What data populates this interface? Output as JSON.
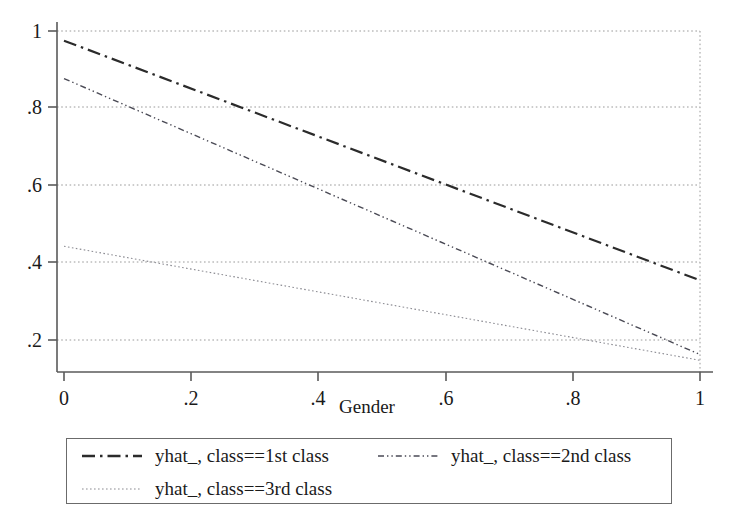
{
  "chart_data": {
    "type": "line",
    "title": "",
    "xlabel": "Gender",
    "ylabel": "",
    "xlim": [
      0,
      1
    ],
    "ylim": [
      0.115,
      1.045
    ],
    "grid": true,
    "grid_axis": "y",
    "legend_position": "bottom",
    "x_ticks": [
      0,
      0.2,
      0.4,
      0.6,
      0.8,
      1
    ],
    "x_tick_labels": [
      "0",
      ".2",
      ".4",
      ".6",
      ".8",
      "1"
    ],
    "y_ticks": [
      0.2,
      0.4,
      0.6,
      0.8,
      1
    ],
    "y_tick_labels": [
      ".2",
      ".4",
      ".6",
      ".8",
      "1"
    ],
    "x": [
      0,
      1
    ],
    "series": [
      {
        "name": "yhat_, class==1st class",
        "values": [
          0.975,
          0.355
        ],
        "style": "dash-dot",
        "color": "#2b2b2b",
        "width": 2.2
      },
      {
        "name": "yhat_, class==2nd class",
        "values": [
          0.877,
          0.163
        ],
        "style": "dash-dot-dot",
        "color": "#4a4a55",
        "width": 1.4
      },
      {
        "name": "yhat_, class==3rd class",
        "values": [
          0.443,
          0.148
        ],
        "style": "dotted",
        "color": "#8b8b92",
        "width": 1.1
      }
    ]
  },
  "axes": {
    "x_title": "Gender",
    "x_tick_labels": [
      "0",
      ".2",
      ".4",
      ".6",
      ".8",
      "1"
    ],
    "y_tick_labels": [
      "1",
      ".8",
      ".6",
      ".4",
      ".2"
    ]
  },
  "legend": {
    "entries": [
      {
        "label": "yhat_, class==1st class",
        "key": "dash-dot-key"
      },
      {
        "label": "yhat_, class==2nd class",
        "key": "dash-dot-dot-key"
      },
      {
        "label": "yhat_, class==3rd class",
        "key": "dotted-key"
      }
    ]
  },
  "colors": {
    "series_1": "#2b2b2b",
    "series_2": "#4a4a55",
    "series_3": "#8b8b92",
    "axis": "#5a5a5a",
    "grid": "#9a9a9a",
    "background": "#ffffff",
    "text": "#1a1a1a"
  }
}
